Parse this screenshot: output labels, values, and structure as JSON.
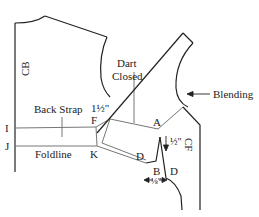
{
  "diagram": {
    "type": "sewing-pattern",
    "labels": {
      "cb": "CB",
      "cf": "CF",
      "dart_closed_line1": "Dart",
      "dart_closed_line2": "Closed",
      "back_strap": "Back Strap",
      "one_half_top": "1½\"",
      "blending": "Blending",
      "point_i": "I",
      "point_j": "J",
      "point_f": "F",
      "point_k": "K",
      "point_a": "A",
      "point_b": "B",
      "point_d_left": "D",
      "point_d_right": "D",
      "foldline": "Foldline",
      "half_inch": "½\"",
      "eighth_inch": "⅛\""
    },
    "colors": {
      "outline": "#222222",
      "guide": "#777777",
      "background": "#ffffff"
    }
  }
}
